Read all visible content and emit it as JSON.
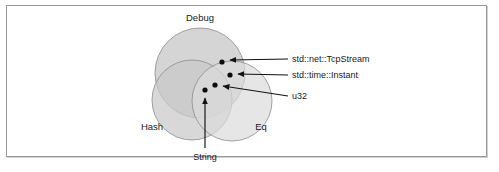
{
  "figure": {
    "caption_title": "",
    "background_color": "#ffffff",
    "frame_color": "#9a9a9a"
  },
  "diagram": {
    "type": "venn-3-set",
    "sets": [
      {
        "id": "debug",
        "label": "Debug",
        "cx": 200,
        "cy": 73,
        "r": 45,
        "fill": "#cfcfcf",
        "label_x": 200,
        "label_y": 21
      },
      {
        "id": "hash",
        "label": "Hash",
        "cx": 192,
        "cy": 100,
        "r": 40,
        "fill": "#cfcfcf",
        "label_x": 152,
        "label_y": 130
      },
      {
        "id": "eq",
        "label": "Eq",
        "cx": 232,
        "cy": 101,
        "r": 40,
        "fill": "#e0e0e0",
        "label_x": 261,
        "label_y": 130
      }
    ],
    "points": [
      {
        "id": "tcpstream",
        "label": "std::net::TcpStream",
        "x": 222,
        "y": 62,
        "region": "debug-only",
        "label_x": 292,
        "label_y": 62,
        "arrow_from_x": 288,
        "arrow_from_y": 59,
        "arrow_to_x": 228,
        "arrow_to_y": 60
      },
      {
        "id": "instant",
        "label": "std::time::Instant",
        "x": 230,
        "y": 75,
        "region": "debug-eq",
        "label_x": 292,
        "label_y": 78,
        "arrow_from_x": 288,
        "arrow_from_y": 75,
        "arrow_to_x": 236,
        "arrow_to_y": 74
      },
      {
        "id": "u32",
        "label": "u32",
        "x": 215,
        "y": 85,
        "region": "debug-hash-eq",
        "label_x": 292,
        "label_y": 99,
        "arrow_from_x": 288,
        "arrow_from_y": 96,
        "arrow_to_x": 221,
        "arrow_to_y": 86
      },
      {
        "id": "string",
        "label": "String",
        "x": 205,
        "y": 90,
        "region": "debug-hash-eq",
        "label_x": 205,
        "label_y": 158,
        "arrow_from_x": 205,
        "arrow_from_y": 148,
        "arrow_to_x": 205,
        "arrow_to_y": 96
      }
    ],
    "dot_radius": 2.6,
    "colors": {
      "dot": "#0d0d0d",
      "leader": "#111111",
      "circle_stroke": "#8c8c8c",
      "text": "#1a1a1a"
    }
  }
}
